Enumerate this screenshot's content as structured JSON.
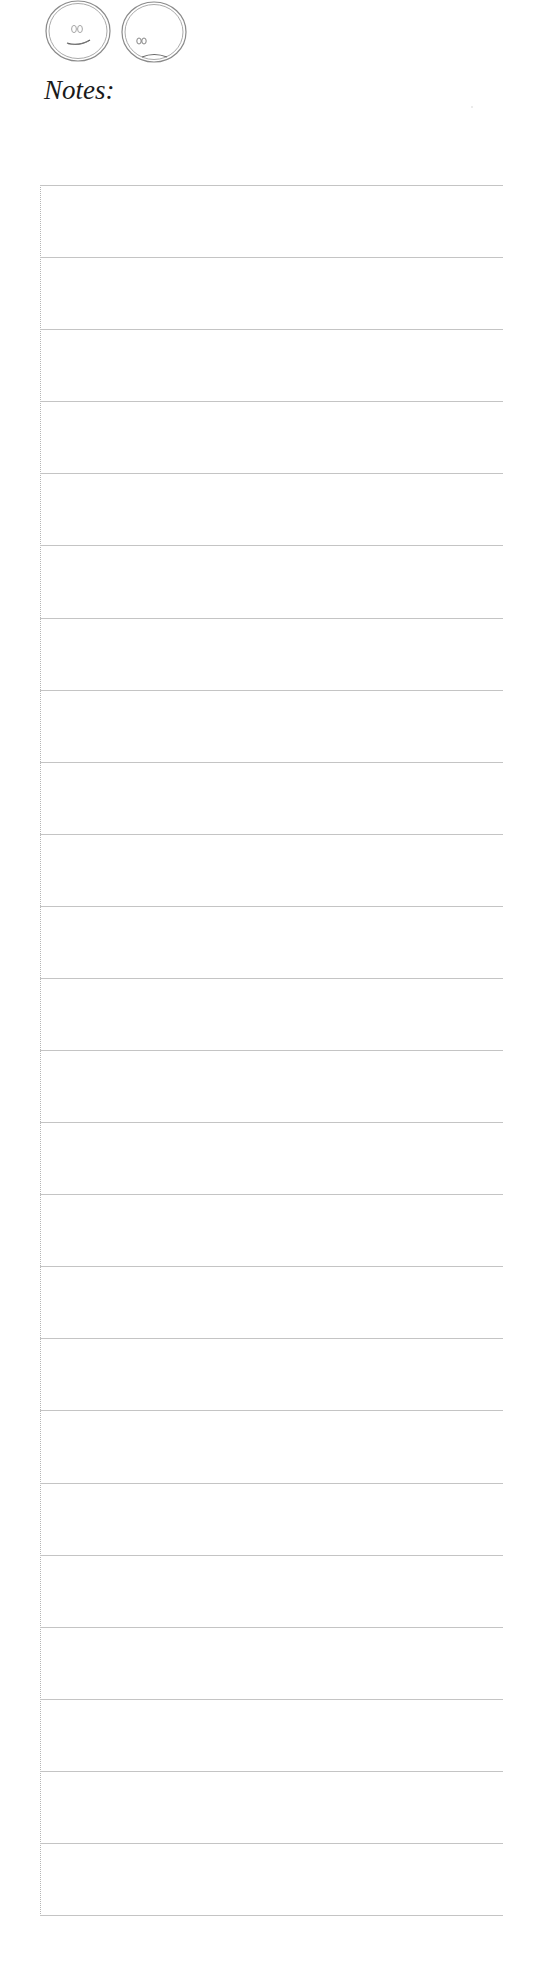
{
  "header": {
    "icons": [
      {
        "name": "happy-face-icon",
        "meaning": "happy"
      },
      {
        "name": "sad-face-icon",
        "meaning": "sad"
      }
    ],
    "title": "Notes:"
  },
  "ruled_area": {
    "line_count": 25,
    "line_color": "#c4c4c4",
    "border_color": "#b5b5b5",
    "lines": [
      "",
      "",
      "",
      "",
      "",
      "",
      "",
      "",
      "",
      "",
      "",
      "",
      "",
      "",
      "",
      "",
      "",
      "",
      "",
      "",
      "",
      "",
      "",
      "",
      ""
    ]
  }
}
